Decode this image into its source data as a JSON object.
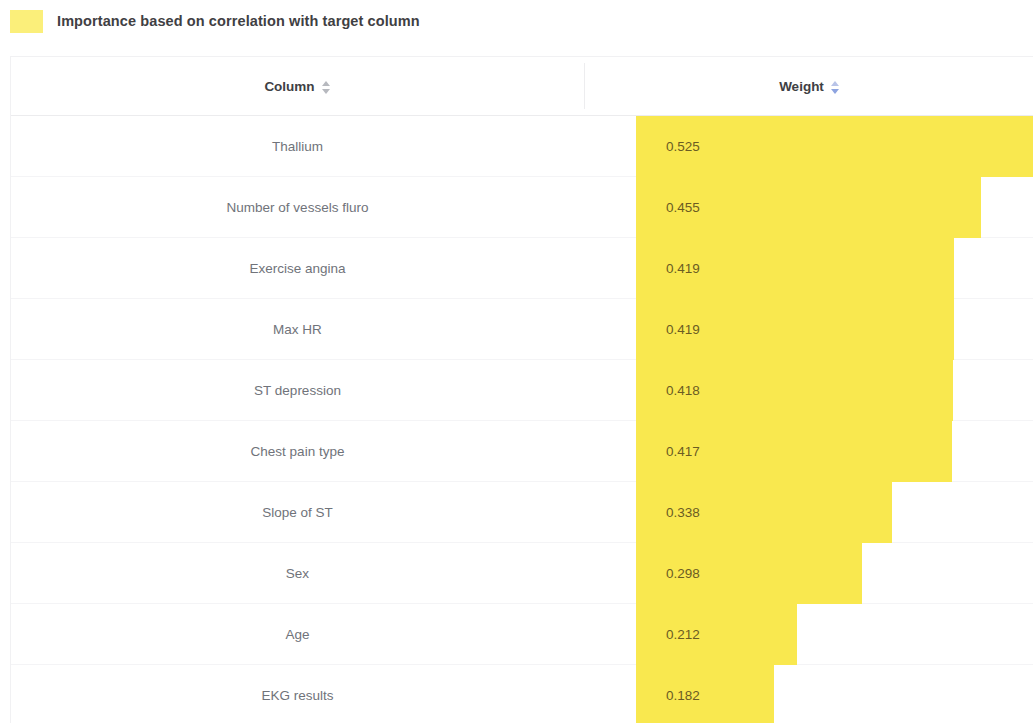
{
  "legend": {
    "swatch_color": "#fbef7a",
    "title": "Importance based on correlation with target column"
  },
  "table": {
    "headers": {
      "column": "Column",
      "weight": "Weight"
    },
    "sort": {
      "column_state": "none",
      "weight_state": "descending"
    }
  },
  "chart_data": {
    "type": "bar",
    "title": "Importance based on correlation with target column",
    "xlabel": "Weight",
    "ylabel": "Column",
    "orientation": "horizontal",
    "bar_color": "#f9e84f",
    "xlim": [
      0,
      0.525
    ],
    "grid": false,
    "legend": "Importance based on correlation with target column",
    "categories": [
      "Thallium",
      "Number of vessels fluro",
      "Exercise angina",
      "Max HR",
      "ST depression",
      "Chest pain type",
      "Slope of ST",
      "Sex",
      "Age",
      "EKG results"
    ],
    "values": [
      0.525,
      0.455,
      0.419,
      0.419,
      0.418,
      0.417,
      0.338,
      0.298,
      0.212,
      0.182
    ],
    "value_labels": [
      "0.525",
      "0.455",
      "0.419",
      "0.419",
      "0.418",
      "0.417",
      "0.338",
      "0.298",
      "0.212",
      "0.182"
    ]
  },
  "rows": [
    {
      "column": "Thallium",
      "weight": "0.525",
      "value": 0.525
    },
    {
      "column": "Number of vessels fluro",
      "weight": "0.455",
      "value": 0.455
    },
    {
      "column": "Exercise angina",
      "weight": "0.419",
      "value": 0.419
    },
    {
      "column": "Max HR",
      "weight": "0.419",
      "value": 0.419
    },
    {
      "column": "ST depression",
      "weight": "0.418",
      "value": 0.418
    },
    {
      "column": "Chest pain type",
      "weight": "0.417",
      "value": 0.417
    },
    {
      "column": "Slope of ST",
      "weight": "0.338",
      "value": 0.338
    },
    {
      "column": "Sex",
      "weight": "0.298",
      "value": 0.298
    },
    {
      "column": "Age",
      "weight": "0.212",
      "value": 0.212
    },
    {
      "column": "EKG results",
      "weight": "0.182",
      "value": 0.182
    }
  ]
}
